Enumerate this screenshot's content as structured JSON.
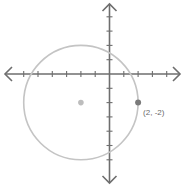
{
  "diagram": {
    "type": "coordinate-plane-circle",
    "unit_px": 14.3,
    "origin_px": [
      109.5,
      74
    ],
    "x_range": [
      -6,
      4
    ],
    "y_range": [
      -6,
      4
    ],
    "axis_color": "#6e6e6e",
    "circle_color": "#c4c4c4",
    "center_color": "#bdbdbd",
    "point_color": "#7a7a7a",
    "label_color": "#6a6a6a",
    "circle": {
      "center": [
        -2,
        -2
      ],
      "radius": 4
    },
    "center_point": {
      "x": -2,
      "y": -2
    },
    "marked_point": {
      "x": 2,
      "y": -2,
      "label": "(2, -2)"
    }
  }
}
